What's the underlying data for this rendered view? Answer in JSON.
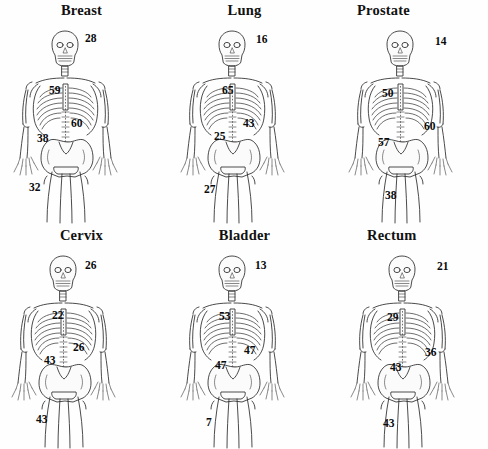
{
  "figure": {
    "type": "skeleton-distribution-diagram",
    "background_color": "#ffffff",
    "text_color": "#0d0d0d",
    "grid": {
      "rows": 2,
      "columns": 3
    }
  },
  "panels": [
    {
      "id": "breast",
      "title": "Breast",
      "labels": [
        {
          "name": "skull",
          "value": "28"
        },
        {
          "name": "ribs",
          "value": "59"
        },
        {
          "name": "spine",
          "value": "60"
        },
        {
          "name": "pelvis",
          "value": "38"
        },
        {
          "name": "femur",
          "value": "32"
        }
      ]
    },
    {
      "id": "lung",
      "title": "Lung",
      "labels": [
        {
          "name": "skull",
          "value": "16"
        },
        {
          "name": "ribs",
          "value": "65"
        },
        {
          "name": "spine",
          "value": "43"
        },
        {
          "name": "pelvis",
          "value": "25"
        },
        {
          "name": "femur",
          "value": "27"
        }
      ]
    },
    {
      "id": "prostate",
      "title": "Prostate",
      "labels": [
        {
          "name": "skull",
          "value": "14"
        },
        {
          "name": "ribs",
          "value": "50"
        },
        {
          "name": "spine",
          "value": "60"
        },
        {
          "name": "pelvis",
          "value": "57"
        },
        {
          "name": "femur",
          "value": "38"
        }
      ]
    },
    {
      "id": "cervix",
      "title": "Cervix",
      "labels": [
        {
          "name": "skull",
          "value": "26"
        },
        {
          "name": "ribs",
          "value": "22"
        },
        {
          "name": "spine",
          "value": "26"
        },
        {
          "name": "pelvis",
          "value": "43"
        },
        {
          "name": "femur",
          "value": "43"
        }
      ]
    },
    {
      "id": "bladder",
      "title": "Bladder",
      "labels": [
        {
          "name": "skull",
          "value": "13"
        },
        {
          "name": "ribs",
          "value": "53"
        },
        {
          "name": "spine",
          "value": "47"
        },
        {
          "name": "pelvis",
          "value": "47"
        },
        {
          "name": "femur",
          "value": "7"
        }
      ]
    },
    {
      "id": "rectum",
      "title": "Rectum",
      "labels": [
        {
          "name": "skull",
          "value": "21"
        },
        {
          "name": "ribs",
          "value": "29"
        },
        {
          "name": "spine",
          "value": "36"
        },
        {
          "name": "pelvis",
          "value": "43"
        },
        {
          "name": "femur",
          "value": "43"
        }
      ]
    }
  ]
}
